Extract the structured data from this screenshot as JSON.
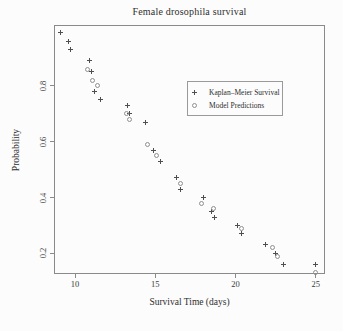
{
  "figure": {
    "title": "Female drosophila survival",
    "x_axis_label": "Survival Time (days)",
    "y_axis_label": "Probability"
  },
  "colors": {
    "background": "#fcfcfc",
    "frame": "#8a8a8a",
    "text": "#2e2e2e",
    "km_marker": "#4f4f4f",
    "model_marker": "#8f8f8f",
    "legend_border": "#9a9a9a"
  },
  "legend": {
    "items": [
      {
        "label": "Kaplan–Meier Survival",
        "marker": "plus"
      },
      {
        "label": "Model Predictions",
        "marker": "circle"
      }
    ]
  },
  "chart_data": {
    "type": "scatter",
    "title": "Female drosophila survival",
    "xlabel": "Survival Time (days)",
    "ylabel": "Probability",
    "xlim": [
      8.69,
      25.58
    ],
    "ylim": [
      0.126,
      1.018
    ],
    "x_ticks": [
      10,
      15,
      20,
      25
    ],
    "y_ticks": [
      0.2,
      0.4,
      0.6,
      0.8
    ],
    "grid": false,
    "legend_position": "center-right",
    "series": [
      {
        "name": "Kaplan–Meier Survival",
        "marker": "plus",
        "points": [
          [
            9.1,
            0.99
          ],
          [
            9.6,
            0.96
          ],
          [
            9.7,
            0.93
          ],
          [
            10.9,
            0.89
          ],
          [
            11.0,
            0.85
          ],
          [
            11.2,
            0.78
          ],
          [
            11.6,
            0.75
          ],
          [
            13.3,
            0.73
          ],
          [
            13.4,
            0.7
          ],
          [
            14.4,
            0.67
          ],
          [
            14.9,
            0.57
          ],
          [
            15.3,
            0.53
          ],
          [
            16.3,
            0.47
          ],
          [
            16.6,
            0.43
          ],
          [
            18.0,
            0.4
          ],
          [
            18.5,
            0.35
          ],
          [
            18.7,
            0.33
          ],
          [
            20.1,
            0.3
          ],
          [
            20.4,
            0.27
          ],
          [
            21.9,
            0.23
          ],
          [
            22.5,
            0.2
          ],
          [
            23.0,
            0.16
          ],
          [
            25.0,
            0.16
          ]
        ]
      },
      {
        "name": "Model Predictions",
        "marker": "circle",
        "points": [
          [
            10.8,
            0.86
          ],
          [
            11.1,
            0.82
          ],
          [
            11.4,
            0.8
          ],
          [
            13.2,
            0.7
          ],
          [
            13.4,
            0.68
          ],
          [
            14.5,
            0.59
          ],
          [
            15.1,
            0.55
          ],
          [
            16.6,
            0.45
          ],
          [
            17.9,
            0.38
          ],
          [
            18.6,
            0.36
          ],
          [
            20.4,
            0.29
          ],
          [
            22.3,
            0.22
          ],
          [
            22.6,
            0.19
          ],
          [
            25.0,
            0.13
          ]
        ]
      }
    ]
  }
}
